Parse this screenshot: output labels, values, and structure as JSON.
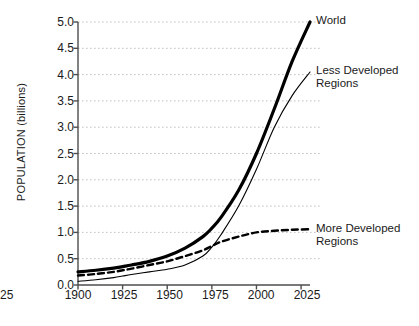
{
  "chart_data": {
    "type": "line",
    "title": "",
    "subtitle": "",
    "xlabel": "",
    "ylabel": "POPULATION (billions)",
    "xlim": [
      1900,
      2030
    ],
    "ylim": [
      0.0,
      5.0
    ],
    "grid": "horizontal-dotted",
    "legend_position": "right-inline-annotations",
    "x_ticks": [
      "1900",
      "1925",
      "1950",
      "1975",
      "2000",
      "2025"
    ],
    "x_tick_values": [
      1900,
      1925,
      1950,
      1975,
      2000,
      2025
    ],
    "y_ticks": [
      "0.0",
      "0.5",
      "1.0",
      "1.5",
      "2.0",
      "2.5",
      "3.0",
      "3.5",
      "4.0",
      "4.5",
      "5.0"
    ],
    "y_tick_values": [
      0.0,
      0.5,
      1.0,
      1.5,
      2.0,
      2.5,
      3.0,
      3.5,
      4.0,
      4.5,
      5.0
    ],
    "x": [
      1900,
      1910,
      1920,
      1925,
      1930,
      1940,
      1950,
      1960,
      1970,
      1975,
      1980,
      1990,
      2000,
      2010,
      2020,
      2030
    ],
    "series": [
      {
        "name": "World",
        "label": "World",
        "style": "thick-solid",
        "color": "#000000",
        "values": [
          0.25,
          0.28,
          0.32,
          0.35,
          0.38,
          0.45,
          0.55,
          0.7,
          0.92,
          1.08,
          1.28,
          1.8,
          2.5,
          3.35,
          4.25,
          5.0
        ]
      },
      {
        "name": "Less Developed Regions",
        "label": "Less Developed\nRegions",
        "style": "thin-solid",
        "color": "#000000",
        "values": [
          0.07,
          0.1,
          0.14,
          0.17,
          0.2,
          0.25,
          0.3,
          0.38,
          0.55,
          0.72,
          0.95,
          1.5,
          2.2,
          3.0,
          3.6,
          4.05
        ]
      },
      {
        "name": "More Developed Regions",
        "label": "More Developed\nRegions",
        "style": "dashed",
        "color": "#000000",
        "values": [
          0.18,
          0.21,
          0.25,
          0.28,
          0.31,
          0.38,
          0.45,
          0.55,
          0.66,
          0.74,
          0.82,
          0.92,
          1.0,
          1.03,
          1.05,
          1.06
        ]
      }
    ],
    "annotations": [
      {
        "text": "World",
        "series": "World",
        "at_x": 2030,
        "at_y": 5.0
      },
      {
        "text": "Less Developed Regions",
        "series": "Less Developed Regions",
        "at_x": 2030,
        "at_y": 4.05
      },
      {
        "text": "More Developed Regions",
        "series": "More Developed Regions",
        "at_x": 2030,
        "at_y": 1.06
      }
    ],
    "colors": {
      "axis": "#4d4d4d",
      "grid": "#b3b3b3",
      "text": "#1a1a1a",
      "background": "#ffffff"
    }
  }
}
